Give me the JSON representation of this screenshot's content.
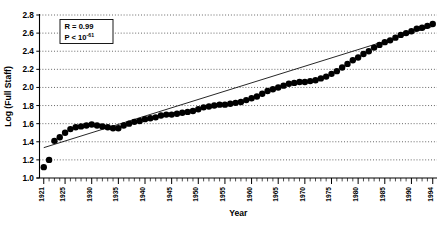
{
  "chart_data": {
    "type": "scatter",
    "title": "",
    "xlabel": "Year",
    "ylabel": "Log (Full Staff)",
    "xlim": [
      1920.2,
      1994.8
    ],
    "ylim": [
      1.0,
      2.8
    ],
    "grid": true,
    "grid_orientation": "horizontal",
    "legend": false,
    "ytick_labels": [
      "1.0",
      "1.2",
      "1.4",
      "1.6",
      "1.8",
      "2.0",
      "2.2",
      "2.4",
      "2.6",
      "2.8"
    ],
    "ytick_values": [
      1.0,
      1.2,
      1.4,
      1.6,
      1.8,
      2.0,
      2.2,
      2.4,
      2.6,
      2.8
    ],
    "xtick_labels": [
      "1921",
      "1925",
      "1930",
      "1935",
      "1940",
      "1945",
      "1950",
      "1955",
      "1960",
      "1965",
      "1970",
      "1975",
      "1980",
      "1985",
      "1990",
      "1994"
    ],
    "xtick_values": [
      1921,
      1925,
      1930,
      1935,
      1940,
      1945,
      1950,
      1955,
      1960,
      1965,
      1970,
      1975,
      1980,
      1985,
      1990,
      1994
    ],
    "xtick_minor_step": 1,
    "annotations": [
      {
        "label_r": "R = 0.99",
        "label_p_prefix": "P < 10",
        "label_p_exponent": "-61"
      }
    ],
    "fit_line": {
      "x": [
        1921,
        1994
      ],
      "y": [
        1.335,
        2.675
      ]
    },
    "marker": {
      "shape": "circle",
      "color": "#000000",
      "size": 3.2
    },
    "x": [
      1921,
      1922,
      1923,
      1924,
      1925,
      1926,
      1927,
      1928,
      1929,
      1930,
      1931,
      1932,
      1933,
      1934,
      1935,
      1936,
      1937,
      1938,
      1939,
      1940,
      1941,
      1942,
      1943,
      1944,
      1945,
      1946,
      1947,
      1948,
      1949,
      1950,
      1951,
      1952,
      1953,
      1954,
      1955,
      1956,
      1957,
      1958,
      1959,
      1960,
      1961,
      1962,
      1963,
      1964,
      1965,
      1966,
      1967,
      1968,
      1969,
      1970,
      1971,
      1972,
      1973,
      1974,
      1975,
      1976,
      1977,
      1978,
      1979,
      1980,
      1981,
      1982,
      1983,
      1984,
      1985,
      1986,
      1987,
      1988,
      1989,
      1990,
      1991,
      1992,
      1993,
      1994
    ],
    "y": [
      1.12,
      1.2,
      1.41,
      1.45,
      1.5,
      1.54,
      1.56,
      1.57,
      1.58,
      1.59,
      1.58,
      1.57,
      1.56,
      1.55,
      1.55,
      1.58,
      1.6,
      1.62,
      1.63,
      1.65,
      1.66,
      1.67,
      1.69,
      1.7,
      1.7,
      1.71,
      1.72,
      1.73,
      1.74,
      1.76,
      1.78,
      1.79,
      1.8,
      1.81,
      1.81,
      1.82,
      1.83,
      1.84,
      1.86,
      1.88,
      1.9,
      1.93,
      1.96,
      1.98,
      2.0,
      2.02,
      2.04,
      2.05,
      2.06,
      2.06,
      2.07,
      2.08,
      2.1,
      2.12,
      2.15,
      2.18,
      2.22,
      2.26,
      2.3,
      2.33,
      2.37,
      2.4,
      2.44,
      2.47,
      2.5,
      2.52,
      2.55,
      2.58,
      2.6,
      2.62,
      2.65,
      2.66,
      2.68,
      2.7
    ]
  }
}
